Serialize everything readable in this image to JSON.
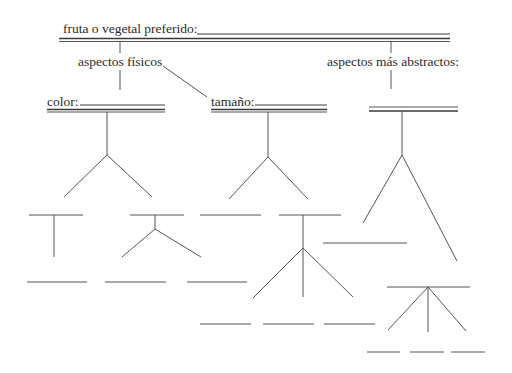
{
  "diagram": {
    "type": "graphic-organizer-tree",
    "root": {
      "label": "fruta o vegetal preferido:",
      "blank": ""
    },
    "branches": [
      {
        "label": "aspectos físicos",
        "children": [
          {
            "label": "color:",
            "blank": "",
            "sub_branches": 2
          },
          {
            "label": "tamaño:",
            "blank": "",
            "sub_branches": 2
          }
        ]
      },
      {
        "label": "aspectos más abstractos:",
        "children": [
          {
            "label": "",
            "blank": "",
            "sub_branches": 2
          }
        ]
      }
    ]
  },
  "labels": {
    "root": "fruta o vegetal preferido:",
    "physical": "aspectos físicos",
    "abstract": "aspectos más abstractos:",
    "color": "color:",
    "size": "tamaño:"
  },
  "colors": {
    "line": "#3a3a3a",
    "text": "#2b2b2b",
    "background": "#ffffff"
  }
}
